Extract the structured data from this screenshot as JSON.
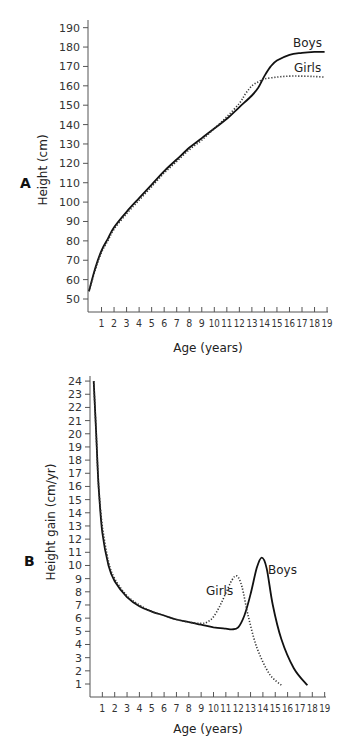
{
  "chart_data": [
    {
      "panel": "A",
      "type": "line",
      "xlabel": "Age (years)",
      "ylabel": "Height (cm)",
      "x_ticks": [
        1,
        2,
        3,
        4,
        5,
        6,
        7,
        8,
        9,
        10,
        11,
        12,
        13,
        14,
        15,
        16,
        17,
        18,
        19
      ],
      "y_ticks": [
        50,
        60,
        70,
        80,
        90,
        100,
        110,
        120,
        130,
        140,
        150,
        160,
        170,
        180,
        190
      ],
      "xlim": [
        0,
        19
      ],
      "ylim": [
        45,
        190
      ],
      "grid": false,
      "series": [
        {
          "name": "Boys",
          "style": "solid",
          "points": [
            [
              0,
              54
            ],
            [
              0.5,
              66
            ],
            [
              1,
              75
            ],
            [
              1.5,
              81
            ],
            [
              2,
              87
            ],
            [
              3,
              95
            ],
            [
              4,
              102
            ],
            [
              5,
              109
            ],
            [
              6,
              116
            ],
            [
              7,
              122
            ],
            [
              8,
              128
            ],
            [
              9,
              133
            ],
            [
              10,
              138
            ],
            [
              11,
              143
            ],
            [
              12,
              149
            ],
            [
              13,
              155
            ],
            [
              13.5,
              159
            ],
            [
              14,
              165
            ],
            [
              14.5,
              170
            ],
            [
              15,
              173
            ],
            [
              16,
              176
            ],
            [
              17,
              177
            ],
            [
              18,
              177.5
            ],
            [
              18.8,
              177.5
            ]
          ]
        },
        {
          "name": "Girls",
          "style": "dotted",
          "points": [
            [
              0,
              54
            ],
            [
              0.5,
              65
            ],
            [
              1,
              74
            ],
            [
              1.5,
              80
            ],
            [
              2,
              86
            ],
            [
              3,
              94
            ],
            [
              4,
              101
            ],
            [
              5,
              108
            ],
            [
              6,
              115
            ],
            [
              7,
              121
            ],
            [
              8,
              127
            ],
            [
              9,
              132
            ],
            [
              10,
              138
            ],
            [
              11,
              144
            ],
            [
              12,
              151
            ],
            [
              12.5,
              156
            ],
            [
              13,
              160
            ],
            [
              13.5,
              162
            ],
            [
              14,
              163.5
            ],
            [
              15,
              164.5
            ],
            [
              16,
              165
            ],
            [
              17,
              165
            ],
            [
              18,
              164.8
            ],
            [
              18.8,
              164.5
            ]
          ]
        }
      ]
    },
    {
      "panel": "B",
      "type": "line",
      "xlabel": "Age (years)",
      "ylabel": "Height gain (cm/yr)",
      "x_ticks": [
        1,
        2,
        3,
        4,
        5,
        6,
        7,
        8,
        9,
        10,
        11,
        12,
        13,
        14,
        15,
        16,
        17,
        18,
        19
      ],
      "y_ticks": [
        1,
        2,
        3,
        4,
        5,
        6,
        7,
        8,
        9,
        10,
        11,
        12,
        13,
        14,
        15,
        16,
        17,
        18,
        19,
        20,
        21,
        22,
        23,
        24
      ],
      "xlim": [
        0,
        19
      ],
      "ylim": [
        0,
        24
      ],
      "grid": false,
      "series": [
        {
          "name": "Boys",
          "style": "solid",
          "points": [
            [
              0.3,
              24
            ],
            [
              0.5,
              20
            ],
            [
              0.7,
              16
            ],
            [
              1,
              12.5
            ],
            [
              1.5,
              10
            ],
            [
              2,
              8.8
            ],
            [
              3,
              7.6
            ],
            [
              4,
              6.9
            ],
            [
              5,
              6.5
            ],
            [
              6,
              6.2
            ],
            [
              7,
              5.9
            ],
            [
              8,
              5.7
            ],
            [
              9,
              5.5
            ],
            [
              10,
              5.3
            ],
            [
              11,
              5.2
            ],
            [
              11.5,
              5.15
            ],
            [
              12,
              5.3
            ],
            [
              12.5,
              6.2
            ],
            [
              13,
              7.8
            ],
            [
              13.5,
              9.8
            ],
            [
              13.9,
              10.6
            ],
            [
              14.3,
              9.8
            ],
            [
              14.8,
              7.0
            ],
            [
              15.5,
              4.4
            ],
            [
              16.5,
              2.2
            ],
            [
              17.6,
              0.9
            ]
          ]
        },
        {
          "name": "Girls",
          "style": "dotted",
          "points": [
            [
              0.3,
              24
            ],
            [
              0.5,
              20
            ],
            [
              0.7,
              16
            ],
            [
              1,
              13
            ],
            [
              1.5,
              10.3
            ],
            [
              2,
              9
            ],
            [
              3,
              7.7
            ],
            [
              4,
              7.0
            ],
            [
              5,
              6.5
            ],
            [
              6,
              6.2
            ],
            [
              7,
              5.9
            ],
            [
              8,
              5.7
            ],
            [
              9,
              5.6
            ],
            [
              9.5,
              5.7
            ],
            [
              10,
              6.1
            ],
            [
              10.5,
              6.9
            ],
            [
              11,
              7.9
            ],
            [
              11.5,
              8.9
            ],
            [
              11.9,
              9.2
            ],
            [
              12.3,
              8.4
            ],
            [
              12.8,
              6.2
            ],
            [
              13.5,
              3.8
            ],
            [
              14.5,
              1.8
            ],
            [
              15.5,
              0.9
            ]
          ]
        }
      ]
    }
  ],
  "labels": {
    "panel_a": "A",
    "panel_b": "B",
    "boys": "Boys",
    "girls": "Girls",
    "a_ylabel": "Height (cm)",
    "b_ylabel": "Height gain (cm/yr)",
    "xlabel": "Age (years)"
  },
  "colors": {
    "line": "#111111",
    "axis": "#555555"
  }
}
